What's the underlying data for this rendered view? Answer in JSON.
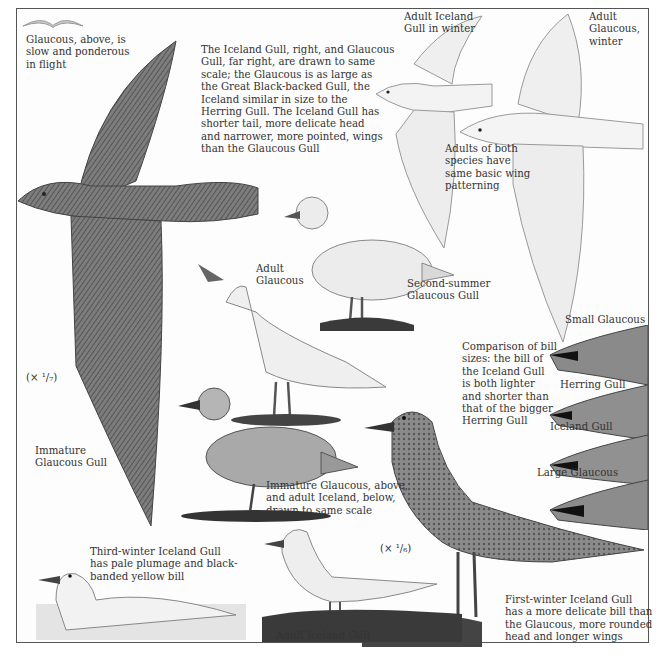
{
  "plate": {
    "subject": "Iceland Gull and Glaucous Gull identification plate",
    "colors": {
      "background": "#fdfdfd",
      "ink": "#333333",
      "frame": "#555555",
      "plumage_dark": "#5e5e5e",
      "plumage_light": "#e9e9e9"
    }
  },
  "captions": {
    "flight_note": "Glaucous, above, is\nslow and ponderous\nin flight",
    "scale_note": "The Iceland Gull, right, and Glaucous\nGull, far right, are drawn to same\nscale; the Glaucous is as large as\nthe Great Black-backed Gull, the\nIceland similar in size to the\nHerring Gull. The Iceland Gull has\nshorter tail, more delicate head\nand narrower, more pointed, wings\nthan the Glaucous Gull",
    "adult_iceland_winter": "Adult Iceland\nGull in winter",
    "adult_glaucous_winter": "Adult\nGlaucous,\nwinter",
    "wing_pattern_note": "Adults of both\nspecies have\nsame basic wing\npatterning",
    "second_summer": "Second-summer\nGlaucous Gull",
    "adult_glaucous": "Adult\nGlaucous",
    "small_glaucous": "Small Glaucous",
    "bill_comparison": "Comparison of bill\nsizes: the bill of\nthe Iceland Gull\nis both lighter\nand shorter than\nthat of the bigger\nHerring Gull",
    "herring_gull": "Herring Gull",
    "iceland_gull_bill": "Iceland Gull",
    "large_glaucous": "Large Glaucous",
    "scale_left": "(× ¹/₇)",
    "immature_glaucous": "Immature\nGlaucous Gull",
    "immature_pair_note": "Immature Glaucous, above,\nand adult Iceland, below,\ndrawn to same scale",
    "scale_right": "(× ¹/₆)",
    "third_winter": "Third-winter Iceland Gull\nhas pale plumage and black-\nbanded yellow bill",
    "adult_iceland": "Adult Iceland Gull",
    "first_winter": "First-winter Iceland Gull\nhas a more delicate bill than\nthe Glaucous, more rounded\nhead and longer wings"
  }
}
